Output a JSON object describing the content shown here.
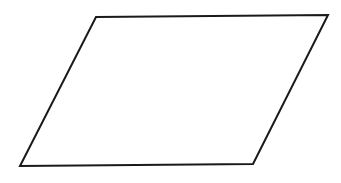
{
  "diagram": {
    "shape": "parallelogram",
    "stroke_color": "#1a1a1a",
    "fill_color": "#ffffff",
    "labels": []
  }
}
